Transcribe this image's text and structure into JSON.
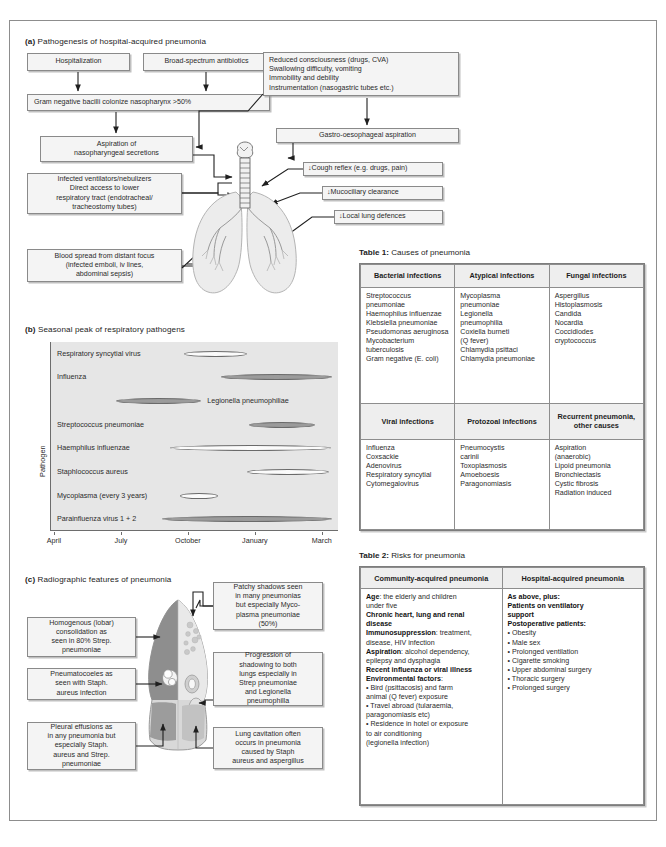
{
  "panels": {
    "a": {
      "label": "(a)",
      "title": "Pathogenesis of hospital-acquired pneumonia"
    },
    "b": {
      "label": "(b)",
      "title": "Seasonal peak of respiratory pathogens"
    },
    "c": {
      "label": "(c)",
      "title": "Radiographic features of pneumonia"
    }
  },
  "flow_a": {
    "hospitalization": "Hospitalization",
    "antibiotics": "Broad-spectrum antibiotics",
    "colonize": "Gram negative bacilli colonize nasopharynx >50%",
    "aspiration": "Aspiration of\nnasopharyngeal secretions",
    "risk_list": "Reduced consciousness (drugs, CVA)\nSwallowing difficulty, vomiting\nImmobility and debility\nInstrumentation (nasogastric tubes etc.)",
    "gastro": "Gastro-oesophageal aspiration",
    "cough": "↓Cough reflex (e.g. drugs, pain)",
    "muco": "↓Mucociliary clearance",
    "local": "↓Local lung defences",
    "ventilators": "Infected ventilators/nebulizers\nDirect access to lower\nrespiratory tract (endotracheal/\ntracheostomy tubes)",
    "blood": "Blood spread from distant focus\n(infected emboli, iv lines,\nabdominal sepsis)"
  },
  "chart_data": {
    "type": "bar",
    "title": "Seasonal peak of respiratory pathogens",
    "xlabel": "",
    "ylabel": "Pathogen",
    "xticks": [
      "April",
      "July",
      "October",
      "January",
      "March"
    ],
    "grid": false,
    "legend": "none",
    "categories": [
      "Respiratory syncytial virus",
      "Influenza",
      "Legionella pneumophiliae",
      "Streptococcus pneumoniae",
      "Haemphilus influenzae",
      "Staphlococcus aureus",
      "Mycoplasma (every 3 years)",
      "Parainfluenza virus 1 + 2"
    ],
    "bars": [
      {
        "label": "Respiratory syncytial virus",
        "start_pct": 46.5,
        "end_pct": 68.5,
        "fill": "open",
        "label_side": "left"
      },
      {
        "label": "Influenza",
        "start_pct": 59.5,
        "end_pct": 98.0,
        "fill": "filled",
        "label_side": "left"
      },
      {
        "label": "Legionella pneumophiliae",
        "start_pct": 23.0,
        "end_pct": 52.5,
        "fill": "filled",
        "label_side": "right"
      },
      {
        "label": "Streptococcus pneumoniae",
        "start_pct": 69.0,
        "end_pct": 92.0,
        "fill": "filled",
        "label_side": "left"
      },
      {
        "label": "Haemphilus influenzae",
        "start_pct": 41.5,
        "end_pct": 97.5,
        "fill": "open",
        "label_side": "left"
      },
      {
        "label": "Staphlococcus aureus",
        "start_pct": 68.5,
        "end_pct": 97.0,
        "fill": "open",
        "label_side": "left"
      },
      {
        "label": "Mycoplasma (every 3 years)",
        "start_pct": 45.0,
        "end_pct": 58.5,
        "fill": "open",
        "label_side": "left"
      },
      {
        "label": "Parainfluenza virus 1 + 2",
        "start_pct": 39.0,
        "end_pct": 98.0,
        "fill": "filled",
        "label_side": "left"
      }
    ]
  },
  "table1": {
    "caption_num": "Table 1:",
    "caption_text": "Causes of pneumonia",
    "headers_top": [
      "Bacterial\ninfections",
      "Atypical\ninfections",
      "Fungal\ninfections"
    ],
    "row_top": [
      "Streptococcus\n pneumoniae\nHaemophilus influenzae\nKlebsiella pneumoniae\nPseudomonas aeruginosa\nMycobacterium\n tuberculosis\nGram negative (E. coli)",
      "Mycoplasma\n pneumoniae\nLegionella\n pneumophilia\nCoxiella burneti\n (Q fever)\nChlamydia psittaci\nChlamydia pneumoniae",
      "Aspergillus\nHistoplasmosis\nCandida\nNocardia\nCoccidiodes\n cryptococcus"
    ],
    "headers_bottom": [
      "Viral\ninfections",
      "Protozoal\ninfections",
      "Recurrent\npneumonia,\nother causes"
    ],
    "row_bottom": [
      "Influenza\nCoxsackie\nAdenovirus\nRespiratory syncytial\nCytomegalovirus",
      "Pneumocystis\n carinii\nToxoplasmosis\nAmoeboesis\nParagonomiasis",
      "Aspiration\n (anaerobic)\nLipoid pneumonia\nBronchiectasis\nCystic fibrosis\nRadiation induced"
    ]
  },
  "table2": {
    "caption_num": "Table 2:",
    "caption_text": "Risks for pneumonia",
    "headers": [
      "Community-acquired pneumonia",
      "Hospital-acquired pneumonia"
    ],
    "community": [
      {
        "bold": "Age",
        "rest": ": the elderly and children"
      },
      {
        "bold": "",
        "rest": "under five"
      },
      {
        "bold": "Chronic heart, lung and renal",
        "rest": ""
      },
      {
        "bold": "disease",
        "rest": ""
      },
      {
        "bold": "Immunosuppression",
        "rest": ": treatment,"
      },
      {
        "bold": "",
        "rest": "disease, HIV infection"
      },
      {
        "bold": "Aspiration",
        "rest": ": alcohol dependency,"
      },
      {
        "bold": "",
        "rest": "epilepsy and dysphagia"
      },
      {
        "bold": "Recent influenza or viral illness",
        "rest": ""
      },
      {
        "bold": "Environmental factors",
        "rest": ":"
      }
    ],
    "community_bullets": [
      "• Bird (psittacosis) and farm\n   animal (Q fever) exposure",
      "• Travel abroad (tularaemia,\n   paragonomiasis etc)",
      "• Residence in hotel or exposure\n   to air conditioning\n   (legionella infection)"
    ],
    "hospital_heads": [
      "As above, plus:",
      "Patients on ventilatory",
      " support",
      "Postoperative patients:"
    ],
    "hospital_bullets": [
      "• Obesity",
      "• Male sex",
      "• Prolonged ventilation",
      "• Cigarette smoking",
      "• Upper abdominal surgery",
      "• Thoracic surgery",
      "• Prolonged surgery"
    ]
  },
  "flow_c": {
    "homogenous": "Homogenous (lobar)\nconsolidation as\nseen in 80% Strep.\npneumoniae",
    "pneumatocoeles": "Pneumatocoeles as\nseen with Staph.\naureus infection",
    "pleural": "Pleural effusions as\nin any pneumonia but\nespecially Staph.\naureus and Strep.\npneumoniae",
    "patchy": "Patchy shadows seen\nin many pneumonias\nbut especially Myco-\nplasma pneumoniae\n(50%)",
    "progression": "Progression of\nshadowing to both\nlungs especially in\nStrep pneumoniae\nand Legionella\npneumophilla",
    "cavitation": "Lung cavitation often\noccurs in pneumonia\ncaused by Staph\naureus and aspergillus"
  },
  "colors": {
    "box_fill": "#f4f4f4",
    "box_border": "#8a8a8a",
    "plot_bg": "#e6e6e6",
    "bar_filled": "#9b9b9b",
    "bar_open": "#fbfbfb",
    "header_fill": "#eeeeee",
    "frame": "#8d8d8d"
  }
}
